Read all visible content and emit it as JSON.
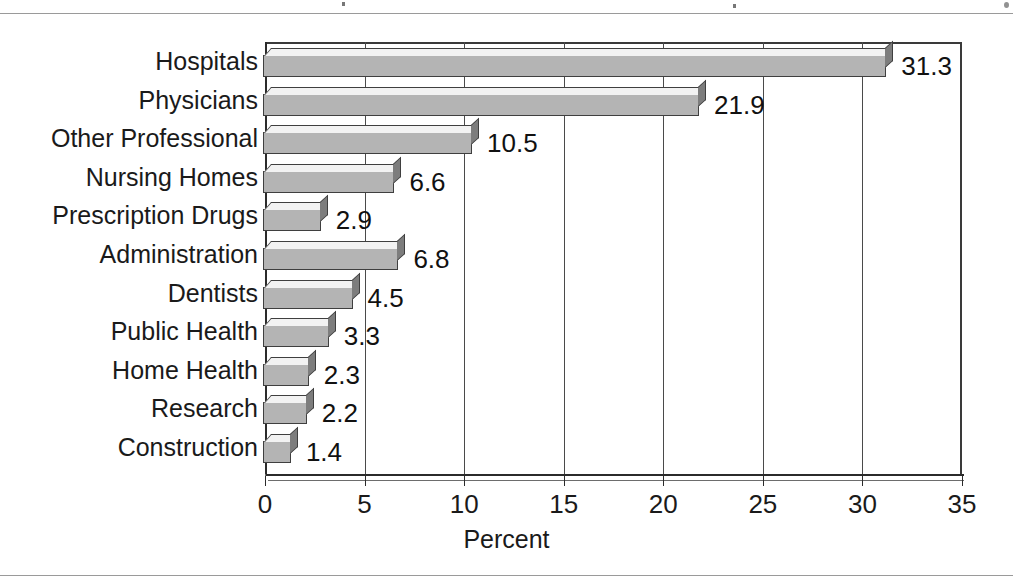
{
  "chart_data": {
    "type": "bar",
    "orientation": "horizontal",
    "title": "",
    "xlabel": "Percent",
    "ylabel": "",
    "categories": [
      "Hospitals",
      "Physicians",
      "Other Professional",
      "Nursing Homes",
      "Prescription Drugs",
      "Administration",
      "Dentists",
      "Public Health",
      "Home Health",
      "Research",
      "Construction"
    ],
    "values": [
      31.3,
      21.9,
      10.5,
      6.6,
      2.9,
      6.8,
      4.5,
      3.3,
      2.3,
      2.2,
      1.4
    ],
    "value_labels": [
      "31.3",
      "21.9",
      "10.5",
      "6.6",
      "2.9",
      "6.8",
      "4.5",
      "3.3",
      "2.3",
      "2.2",
      "1.4"
    ],
    "xlim": [
      0,
      35
    ],
    "xticks": [
      0,
      5,
      10,
      15,
      20,
      25,
      30,
      35
    ],
    "xtick_labels": [
      "0",
      "5",
      "10",
      "15",
      "20",
      "25",
      "30",
      "35"
    ],
    "grid": "vertical",
    "legend": "none",
    "bar_style": "3d",
    "colors": {
      "bar_front": "#b4b4b4",
      "bar_top": "#f2f2f2",
      "bar_side": "#7d7d7d",
      "bar_outline": "#3f3f3f",
      "axis": "#2b2b2b",
      "grid": "#4a4a4a",
      "text": "#1a1a1a",
      "background": "#ffffff"
    }
  }
}
